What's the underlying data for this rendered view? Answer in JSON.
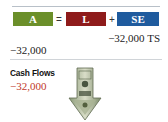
{
  "equation": {
    "assets": {
      "label": "A",
      "color": "#6b8f2a"
    },
    "equals": "=",
    "liabilities": {
      "label": "L",
      "color": "#8e1b1b"
    },
    "plus": "+",
    "equity": {
      "label": "SE",
      "color": "#1f5b9e"
    }
  },
  "changes": {
    "equity_change": "−32,000 TS",
    "assets_change": "−32,000"
  },
  "cash_flows": {
    "title": "Cash Flows",
    "value": "−32,000",
    "value_color": "#c0392b",
    "icon": "money-arrow-down-icon"
  }
}
